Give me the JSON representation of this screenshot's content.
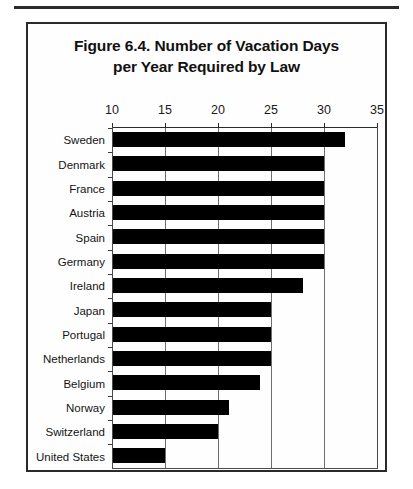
{
  "figure": {
    "title_line1": "Figure 6.4.  Number of Vacation Days",
    "title_line2": "per Year Required by Law"
  },
  "chart_data": {
    "type": "bar",
    "orientation": "horizontal",
    "title": "Figure 6.4.  Number of Vacation Days per Year Required by Law",
    "xlabel": "",
    "ylabel": "",
    "xlim": [
      10,
      35
    ],
    "xticks": [
      10,
      15,
      20,
      25,
      30,
      35
    ],
    "xtick_labels": [
      "10",
      "15",
      "20",
      "25",
      "30",
      "35"
    ],
    "grid": true,
    "grid_axis": "x",
    "legend": false,
    "bar_color": "#000000",
    "categories": [
      "Sweden",
      "Denmark",
      "France",
      "Austria",
      "Spain",
      "Germany",
      "Ireland",
      "Japan",
      "Portugal",
      "Netherlands",
      "Belgium",
      "Norway",
      "Switzerland",
      "United States"
    ],
    "values": [
      32,
      30,
      30,
      30,
      30,
      30,
      28,
      25,
      25,
      25,
      24,
      21,
      20,
      15
    ]
  }
}
